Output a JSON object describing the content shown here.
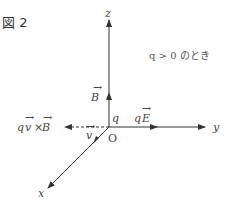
{
  "figure": {
    "title": "図 2",
    "condition_note": "q > 0 のとき",
    "axes": {
      "z_label": "z",
      "y_label": "y",
      "x_label": "x",
      "origin_label": "O"
    },
    "vectors": {
      "B_label": "B",
      "E_force_label_q": "q",
      "E_force_label_E": "E",
      "v_label": "v",
      "lorentz_label_q": "q",
      "lorentz_label_v": "v",
      "lorentz_label_times": "×",
      "lorentz_label_B": "B",
      "charge_label": "q"
    },
    "colors": {
      "line": "#333333",
      "text": "#444444"
    }
  }
}
